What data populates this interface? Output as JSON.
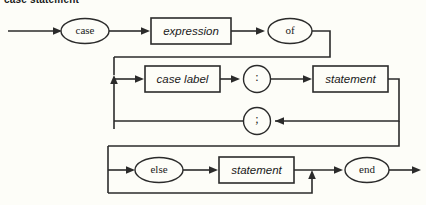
{
  "diagram": {
    "title": "case statement",
    "type": "railroad-syntax-diagram",
    "colors": {
      "background": "#fdfdf8",
      "stroke": "#2b2b2b",
      "text": "#1a1a1a"
    },
    "nodes": [
      {
        "id": "case",
        "label": "case",
        "shape": "oval",
        "kind": "terminal"
      },
      {
        "id": "expression",
        "label": "expression",
        "shape": "box",
        "kind": "nonterminal"
      },
      {
        "id": "of",
        "label": "of",
        "shape": "oval",
        "kind": "terminal"
      },
      {
        "id": "case-label",
        "label": "case label",
        "shape": "box",
        "kind": "nonterminal"
      },
      {
        "id": "colon",
        "label": ":",
        "shape": "circle",
        "kind": "terminal"
      },
      {
        "id": "statement1",
        "label": "statement",
        "shape": "box",
        "kind": "nonterminal"
      },
      {
        "id": "semicolon",
        "label": ";",
        "shape": "circle",
        "kind": "terminal"
      },
      {
        "id": "else",
        "label": "else",
        "shape": "oval",
        "kind": "terminal"
      },
      {
        "id": "statement2",
        "label": "statement",
        "shape": "box",
        "kind": "nonterminal"
      },
      {
        "id": "end",
        "label": "end",
        "shape": "oval",
        "kind": "terminal"
      }
    ]
  }
}
